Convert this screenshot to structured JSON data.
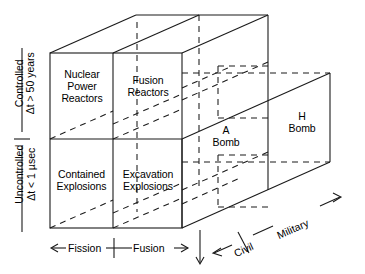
{
  "figure": {
    "type": "3d-cube-diagram",
    "line_color": "#000000",
    "background_color": "#ffffff"
  },
  "front_face_cells": [
    {
      "id": "nuclear-power-reactors",
      "label": "Nuclear\nPower\nReactors",
      "row": "Controlled",
      "column": "Fission",
      "depth": "Civil"
    },
    {
      "id": "fusion-reactors",
      "label": "Fusion\nReactors",
      "row": "Controlled",
      "column": "Fusion",
      "depth": "Civil"
    },
    {
      "id": "contained-explosions",
      "label": "Contained\nExplosions",
      "row": "Uncontrolled",
      "column": "Fission",
      "depth": "Civil"
    },
    {
      "id": "excavation-explosions",
      "label": "Excavation\nExplosions",
      "row": "Uncontrolled",
      "column": "Fusion",
      "depth": "Civil"
    }
  ],
  "side_face_cells": [
    {
      "id": "a-bomb",
      "label": "A\nBomb",
      "row": "Uncontrolled",
      "column": "Fission",
      "depth": "Military"
    },
    {
      "id": "h-bomb",
      "label": "H\nBomb",
      "row": "Uncontrolled",
      "column": "Fusion",
      "depth": "Military"
    }
  ],
  "axes": {
    "vertical": {
      "name": "control-axis",
      "upper": {
        "line1": "Controlled",
        "line2": "Δt > 50 years"
      },
      "lower": {
        "line1": "Uncontrolled",
        "line2": "Δt < 1 µsec"
      }
    },
    "horizontal": {
      "name": "reaction-axis",
      "left": "Fission",
      "right": "Fusion"
    },
    "depth": {
      "name": "application-axis",
      "near": "Civil",
      "far": "Military"
    }
  }
}
